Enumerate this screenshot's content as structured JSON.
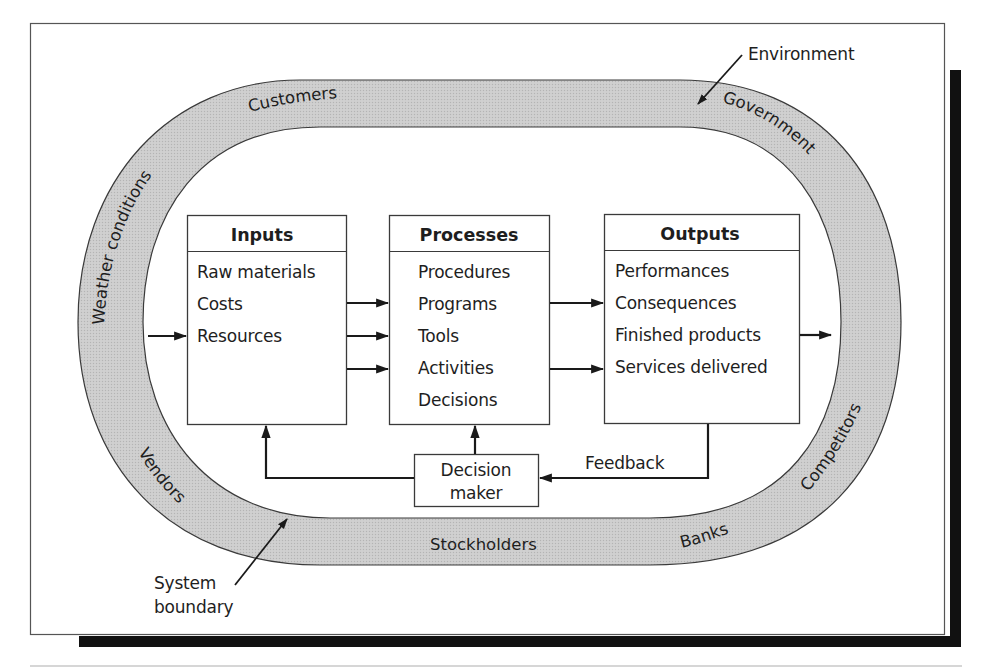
{
  "diagram": {
    "title_annotations": {
      "environment": "Environment",
      "system_boundary_line1": "System",
      "system_boundary_line2": "boundary"
    },
    "environment_ring_labels": {
      "customers": "Customers",
      "government": "Government",
      "weather": "Weather conditions",
      "competitors": "Competitors",
      "vendors": "Vendors",
      "stockholders": "Stockholders",
      "banks": "Banks"
    },
    "boxes": {
      "inputs": {
        "header": "Inputs",
        "items": [
          "Raw materials",
          "Costs",
          "Resources"
        ]
      },
      "processes": {
        "header": "Processes",
        "items": [
          "Procedures",
          "Programs",
          "Tools",
          "Activities",
          "Decisions"
        ]
      },
      "outputs": {
        "header": "Outputs",
        "items": [
          "Performances",
          "Consequences",
          "Finished products",
          "Services delivered"
        ]
      },
      "decision_maker": {
        "line1": "Decision",
        "line2": "maker"
      }
    },
    "feedback_label": "Feedback",
    "colors": {
      "ring_fill": "#c9c9c9",
      "ring_stroke": "#3a3a3a",
      "shadow": "#111111",
      "frame": "#555555"
    }
  }
}
